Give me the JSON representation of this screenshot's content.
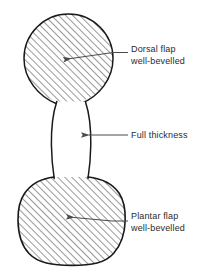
{
  "figure": {
    "background_color": "#ffffff",
    "outline_color": "#1a1a1a",
    "hatch_color": "#3b3b3b",
    "leader_color": "#4a4a4a",
    "text_color": "#2b2b2b"
  },
  "labels": {
    "dorsal": {
      "line1": "Dorsal flap",
      "line2": "well-bevelled"
    },
    "full_thickness": {
      "line1": "Full thickness",
      "line2": ""
    },
    "plantar": {
      "line1": "Plantar flap",
      "line2": "well-bevelled"
    }
  },
  "shapes": [
    {
      "name": "dorsal-flap-lobe",
      "description": "Upper circular hatched lobe",
      "fill": "diagonal-hatch",
      "bounds": {
        "x": 24,
        "y": 14,
        "width": 89,
        "height": 89
      }
    },
    {
      "name": "full-thickness-neck",
      "description": "Central unhatched waist connecting the two lobes",
      "fill": "none",
      "bounds": {
        "x": 51,
        "y": 103,
        "width": 40,
        "height": 74
      }
    },
    {
      "name": "plantar-flap-lobe",
      "description": "Lower rounded hatched lobe",
      "fill": "diagonal-hatch",
      "bounds": {
        "x": 18,
        "y": 177,
        "width": 107,
        "height": 88
      }
    }
  ],
  "leaders": [
    {
      "name": "dorsal-leader",
      "arrow_tip": {
        "x": 71,
        "y": 58
      },
      "elbow": {
        "x": 128,
        "y": 53
      },
      "direction": "left"
    },
    {
      "name": "full-thickness-leader",
      "arrow_tip": {
        "x": 89,
        "y": 135
      },
      "elbow": {
        "x": 128,
        "y": 135
      },
      "direction": "left"
    },
    {
      "name": "plantar-leader",
      "arrow_tip": {
        "x": 74,
        "y": 218
      },
      "elbow": {
        "x": 128,
        "y": 221
      },
      "direction": "left"
    }
  ]
}
